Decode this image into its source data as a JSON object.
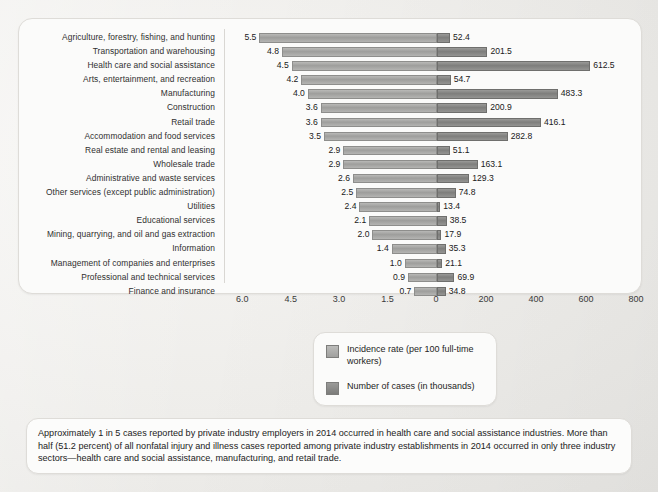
{
  "chart_data": {
    "type": "bar",
    "orientation": "horizontal-diverging",
    "title": "",
    "xlabel": "",
    "ylabel": "",
    "grid": false,
    "legend_position": "bottom-center",
    "categories": [
      "Agriculture, forestry, fishing, and hunting",
      "Transportation and warehousing",
      "Health care and social assistance",
      "Arts, entertainment, and recreation",
      "Manufacturing",
      "Construction",
      "Retail trade",
      "Accommodation and food services",
      "Real estate and rental and leasing",
      "Wholesale trade",
      "Administrative and waste services",
      "Other services (except public administration)",
      "Utilities",
      "Educational services",
      "Mining, quarrying, and oil and gas extraction",
      "Information",
      "Management of companies and enterprises",
      "Professional and technical services",
      "Finance and insurance"
    ],
    "series": [
      {
        "name": "Incidence rate (per 100 full-time workers)",
        "axis": "left",
        "axis_reversed": true,
        "xlim": [
          0,
          6.75
        ],
        "ticks": [
          "6.0",
          "4.5",
          "3.0",
          "1.5",
          "0"
        ],
        "tick_values": [
          6.0,
          4.5,
          3.0,
          1.5,
          0
        ],
        "color": "#a0a09e",
        "values": [
          5.5,
          4.8,
          4.5,
          4.2,
          4.0,
          3.6,
          3.6,
          3.5,
          2.9,
          2.9,
          2.6,
          2.5,
          2.4,
          2.1,
          2.0,
          1.4,
          1.0,
          0.9,
          0.7
        ],
        "labels": [
          "5.5",
          "4.8",
          "4.5",
          "4.2",
          "4.0",
          "3.6",
          "3.6",
          "3.5",
          "2.9",
          "2.9",
          "2.6",
          "2.5",
          "2.4",
          "2.1",
          "2.0",
          "1.4",
          "1.0",
          "0.9",
          "0.7"
        ]
      },
      {
        "name": "Number of cases (in thousands)",
        "axis": "right",
        "xlim": [
          0,
          800
        ],
        "ticks": [
          "0",
          "200",
          "400",
          "600",
          "800"
        ],
        "tick_values": [
          0,
          200,
          400,
          600,
          800
        ],
        "color": "#7c7c7a",
        "values": [
          52.4,
          201.5,
          612.5,
          54.7,
          483.3,
          200.9,
          416.1,
          282.8,
          51.1,
          163.1,
          129.3,
          74.8,
          13.4,
          38.5,
          17.9,
          35.3,
          21.1,
          69.9,
          34.8
        ],
        "labels": [
          "52.4",
          "201.5",
          "612.5",
          "54.7",
          "483.3",
          "200.9",
          "416.1",
          "282.8",
          "51.1",
          "163.1",
          "129.3",
          "74.8",
          "13.4",
          "38.5",
          "17.9",
          "35.3",
          "21.1",
          "69.9",
          "34.8"
        ]
      }
    ]
  },
  "legend": {
    "items": [
      {
        "label": "Incidence rate (per 100 full-time workers)",
        "swatch": "light-grey-swatch"
      },
      {
        "label": "Number of cases (in thousands)",
        "swatch": "dark-grey-swatch"
      }
    ]
  },
  "footnote": {
    "text": "Approximately 1 in 5 cases reported by private industry employers in 2014 occurred in health care and social assistance industries. More than half (51.2 percent) of all nonfatal injury and illness cases reported among private industry establishments in 2014 occurred in only three industry sectors—health care and social assistance, manufacturing, and retail trade."
  }
}
